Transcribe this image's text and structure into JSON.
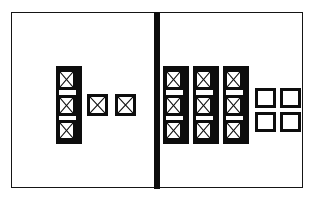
{
  "figure": {
    "title": "",
    "style": "black-and-white line schematic",
    "ink_color": "#0d0d0d",
    "background_color": "#ffffff",
    "frame": {
      "name": "outer-frame",
      "stroke_color": "#151515"
    },
    "divider": {
      "name": "vertical-divider",
      "color": "#0d0d0d",
      "orientation": "vertical"
    }
  },
  "panels": [
    {
      "id": "left",
      "label": "",
      "bracket_groups": [
        {
          "id": "left-group-1",
          "label": "",
          "cell_count": 3,
          "cell_kind": "crossed-square"
        }
      ],
      "free_cells": {
        "count": 2,
        "cell_kind": "crossed-square",
        "labels": [
          "",
          ""
        ]
      },
      "empty_grid": null
    },
    {
      "id": "right",
      "label": "",
      "bracket_groups": [
        {
          "id": "right-group-1",
          "label": "",
          "cell_count": 3,
          "cell_kind": "crossed-square"
        },
        {
          "id": "right-group-2",
          "label": "",
          "cell_count": 3,
          "cell_kind": "crossed-square"
        },
        {
          "id": "right-group-3",
          "label": "",
          "cell_count": 3,
          "cell_kind": "crossed-square"
        }
      ],
      "free_cells": null,
      "empty_grid": {
        "id": "right-empty-grid",
        "rows": 2,
        "columns": 2,
        "count": 4,
        "cell_kind": "empty-square",
        "labels": [
          "",
          "",
          "",
          ""
        ]
      }
    }
  ],
  "icons": {
    "crossed_square": "crossed-square-icon",
    "empty_square": "empty-square-icon",
    "bracket": "bracket-icon"
  }
}
